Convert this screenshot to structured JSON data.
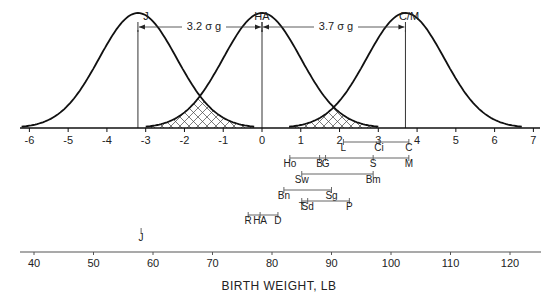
{
  "chart_data": {
    "type": "line",
    "title": "",
    "top_axis": {
      "unit": "sigma_g",
      "range": [
        -6,
        7
      ],
      "ticks": [
        "-6",
        "-5",
        "-4",
        "-3",
        "-2",
        "-1",
        "0",
        "1",
        "2",
        "3",
        "4",
        "5",
        "6",
        "7"
      ]
    },
    "distributions": [
      {
        "name": "J",
        "mean_sigma": -3.2
      },
      {
        "name": "HA",
        "mean_sigma": 0.0
      },
      {
        "name": "C/M",
        "mean_sigma": 3.7
      }
    ],
    "separations": [
      {
        "from": "J",
        "to": "HA",
        "label": "3.2 σ g"
      },
      {
        "from": "HA",
        "to": "C/M",
        "label": "3.7 σ g"
      }
    ],
    "overlap_regions": [
      {
        "between": [
          "J",
          "HA"
        ],
        "pattern": "crosshatch"
      },
      {
        "between": [
          "HA",
          "C/M"
        ],
        "pattern": "crosshatch"
      }
    ],
    "range_bars": [
      {
        "labels": [
          "L",
          "Ci",
          "C"
        ],
        "values_lb": [
          92,
          98,
          103
        ]
      },
      {
        "labels": [
          "Ho",
          "B",
          "G",
          "S",
          "M"
        ],
        "values_lb": [
          83,
          88,
          89,
          97,
          103
        ]
      },
      {
        "labels": [
          "Sw",
          "Bm"
        ],
        "values_lb": [
          85,
          97
        ]
      },
      {
        "labels": [
          "Bn",
          "Sg"
        ],
        "values_lb": [
          82,
          90
        ]
      },
      {
        "labels": [
          "T",
          "Sd",
          "P"
        ],
        "values_lb": [
          85,
          86,
          93
        ]
      },
      {
        "labels": [
          "R",
          "HA",
          "D"
        ],
        "values_lb": [
          76,
          78,
          81
        ]
      },
      {
        "labels": [
          "J"
        ],
        "values_lb": [
          58
        ]
      }
    ],
    "bottom_axis": {
      "xlabel": "BIRTH WEIGHT, LB",
      "range": [
        38,
        124
      ],
      "ticks": [
        "40",
        "50",
        "60",
        "70",
        "80",
        "90",
        "100",
        "110",
        "120"
      ]
    }
  },
  "labels": {
    "peak_j": "J",
    "peak_ha": "HA",
    "peak_cm": "C/M",
    "sep1": "3.2 σ g",
    "sep2": "3.7 σ g",
    "xlabel": "BIRTH WEIGHT, LB"
  }
}
